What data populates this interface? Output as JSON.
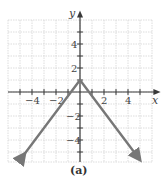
{
  "chart_data": {
    "type": "line",
    "title": "",
    "caption": "(a)",
    "xlabel": "x",
    "ylabel": "y",
    "xlim": [
      -6,
      6
    ],
    "ylim": [
      -6,
      6
    ],
    "grid": true,
    "x_ticks": [
      -4,
      -2,
      2,
      4
    ],
    "y_ticks": [
      4,
      2,
      -2,
      -4
    ],
    "x_tick_labels": [
      "−4",
      "−2",
      "2",
      "4"
    ],
    "y_tick_labels": [
      "4",
      "2",
      "−2",
      "−4"
    ],
    "series": [
      {
        "name": "y = -(4/3)|x| + 1",
        "points": [
          [
            -4.8,
            -5.4
          ],
          [
            0,
            1
          ],
          [
            4.8,
            -5.4
          ]
        ],
        "color": "#777777",
        "arrows": "both-ends"
      }
    ]
  }
}
